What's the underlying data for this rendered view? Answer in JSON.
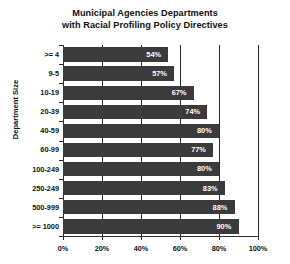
{
  "chart_data": {
    "type": "bar",
    "orientation": "horizontal",
    "title": "Municipal Agencies Departments with Racial Profiling Policy Directives",
    "title_lines": [
      "Municipal Agencies Departments",
      "with Racial Profiling Policy Directives"
    ],
    "xlabel": "",
    "ylabel": "Department Size",
    "categories": [
      ">= 4",
      "9-5",
      "10-19",
      "20-39",
      "40-59",
      "60-99",
      "100-249",
      "250-249",
      "500-999",
      ">= 1000"
    ],
    "values": [
      54,
      57,
      67,
      74,
      80,
      77,
      80,
      83,
      88,
      90
    ],
    "value_labels": [
      "54%",
      "57%",
      "67%",
      "74%",
      "80%",
      "77%",
      "80%",
      "83%",
      "88%",
      "90%"
    ],
    "xlim": [
      0,
      100
    ],
    "xticks": [
      0,
      20,
      40,
      60,
      80,
      100
    ],
    "xtick_labels": [
      "0%",
      "20%",
      "40%",
      "60%",
      "80%",
      "100%"
    ],
    "grid": "vertical",
    "legend": null,
    "colors": {
      "bar": "#3b3b3b",
      "text": "#111111",
      "value_text": "#ffffff",
      "axis": "#2c2c2c",
      "background": "#ffffff"
    }
  }
}
